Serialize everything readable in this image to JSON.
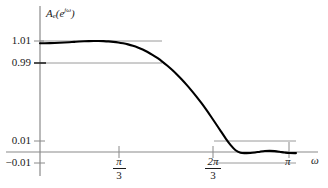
{
  "figure": {
    "y_axis_label": "A",
    "y_axis_label_sub": "e",
    "y_axis_label_arg_open": "(e",
    "y_axis_label_exp": "jω",
    "y_axis_label_close": ")",
    "x_axis_label": "ω",
    "y_ticks": [
      {
        "value": 1.01,
        "text": "1.01"
      },
      {
        "value": 0.99,
        "text": "0.99"
      },
      {
        "value": 0.01,
        "text": "0.01"
      },
      {
        "value": -0.01,
        "text": "−0.01"
      }
    ],
    "x_ticks": [
      {
        "value": 1.0472,
        "num": "π",
        "den": "3"
      },
      {
        "value": 2.0944,
        "num": "2π",
        "den": "3"
      },
      {
        "value": 3.1416,
        "num": "π",
        "den": ""
      }
    ],
    "curve_color": "#000000",
    "gridline_color": "#9a9a9a",
    "axis_color": "#8a8a8a"
  },
  "chart_data": {
    "type": "line",
    "title": "",
    "subtitle": "",
    "xlabel": "ω",
    "ylabel": "A(e^{jω})",
    "xlim": [
      0,
      3.4907
    ],
    "ylim": [
      -0.055,
      1.055
    ],
    "grid": true,
    "legend_position": "none",
    "xtick_values": [
      1.0472,
      2.0944,
      3.1416
    ],
    "xtick_labels": [
      "π/3",
      "2π/3",
      "π"
    ],
    "ytick_values": [
      1.01,
      0.99,
      0.01,
      -0.01
    ],
    "ytick_labels": [
      "1.01",
      "0.99",
      "0.01",
      "−0.01"
    ],
    "gridlines_y": [
      1.01,
      0.99,
      0.01,
      -0.01
    ],
    "annotations": [
      "Passband ripple bounded by 0.99 and 1.01",
      "Stopband ripple bounded by -0.01 and 0.01"
    ],
    "series": [
      {
        "name": "A(e^{jω})",
        "x": [
          0.0,
          0.06,
          0.12,
          0.18,
          0.24,
          0.3,
          0.36,
          0.42,
          0.48,
          0.54,
          0.6,
          0.66,
          0.72,
          0.78,
          0.84,
          0.9,
          0.96,
          1.02,
          1.08,
          1.14,
          1.2,
          1.26,
          1.32,
          1.38,
          1.44,
          1.5,
          1.56,
          1.62,
          1.68,
          1.74,
          1.8,
          1.86,
          1.92,
          1.98,
          2.04,
          2.1,
          2.16,
          2.22,
          2.28,
          2.34,
          2.4,
          2.46,
          2.52,
          2.58,
          2.64,
          2.7,
          2.76,
          2.82,
          2.88,
          2.94,
          3.0,
          3.06,
          3.1416
        ],
        "y": [
          0.99,
          0.9902,
          0.9908,
          0.9919,
          0.9936,
          0.9959,
          0.9987,
          1.0018,
          1.0048,
          1.0074,
          1.0093,
          1.01,
          1.0098,
          1.0086,
          1.0062,
          1.0024,
          0.9969,
          0.9893,
          0.9793,
          0.9666,
          0.951,
          0.9322,
          0.91,
          0.8844,
          0.8554,
          0.823,
          0.7872,
          0.748,
          0.7055,
          0.6598,
          0.611,
          0.559,
          0.504,
          0.446,
          0.385,
          0.321,
          0.255,
          0.188,
          0.122,
          0.062,
          0.016,
          -0.006,
          -0.01,
          -0.009,
          -0.004,
          0.003,
          0.0085,
          0.01,
          0.0078,
          0.0022,
          -0.0045,
          -0.0092,
          -0.01
        ]
      }
    ]
  }
}
